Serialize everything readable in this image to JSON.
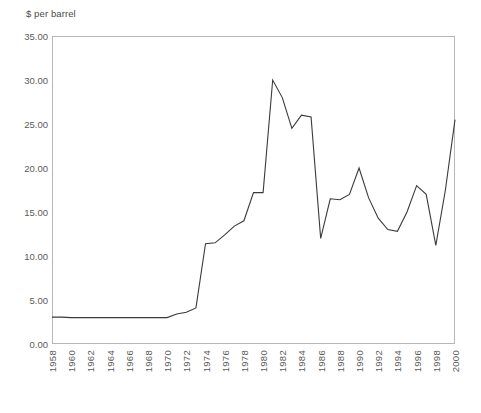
{
  "chart_data": {
    "type": "line",
    "title": "$ per barrel",
    "xlabel": "",
    "ylabel": "$ per barrel",
    "xlim": [
      1958,
      2000
    ],
    "ylim": [
      0,
      35
    ],
    "grid": false,
    "legend": false,
    "y_tick_labels": [
      "35.00",
      "30.00",
      "25.00",
      "20.00",
      "15.00",
      "10.00",
      "5.00",
      "0.00"
    ],
    "y_tick_values": [
      35,
      30,
      25,
      20,
      15,
      10,
      5,
      0
    ],
    "x_tick_labels": [
      "1958",
      "1960",
      "1962",
      "1964",
      "1966",
      "1968",
      "1970",
      "1972",
      "1974",
      "1976",
      "1978",
      "1980",
      "1982",
      "1984",
      "1986",
      "1988",
      "1990",
      "1992",
      "1994",
      "1996",
      "1998",
      "2000"
    ],
    "x_tick_values": [
      1958,
      1960,
      1962,
      1964,
      1966,
      1968,
      1970,
      1972,
      1974,
      1976,
      1978,
      1980,
      1982,
      1984,
      1986,
      1988,
      1990,
      1992,
      1994,
      1996,
      1998,
      2000
    ],
    "line_color": "#3a3a3a",
    "series": [
      {
        "name": "Crude oil price",
        "x": [
          1958,
          1959,
          1960,
          1961,
          1962,
          1963,
          1964,
          1965,
          1966,
          1967,
          1968,
          1969,
          1970,
          1971,
          1972,
          1973,
          1974,
          1975,
          1976,
          1977,
          1978,
          1979,
          1980,
          1981,
          1982,
          1983,
          1984,
          1985,
          1986,
          1987,
          1988,
          1989,
          1990,
          1991,
          1992,
          1993,
          1994,
          1995,
          1996,
          1997,
          1998,
          1999,
          2000
        ],
        "values": [
          3.05,
          3.05,
          3.0,
          3.0,
          3.0,
          3.0,
          3.0,
          3.0,
          3.0,
          3.0,
          3.0,
          3.0,
          3.0,
          3.4,
          3.6,
          4.1,
          11.4,
          11.5,
          12.4,
          13.4,
          14.0,
          17.2,
          17.2,
          30.0,
          28.0,
          24.5,
          26.0,
          25.8,
          12.0,
          16.5,
          16.4,
          17.0,
          20.0,
          16.6,
          14.3,
          13.0,
          12.8,
          15.0,
          18.0,
          17.0,
          11.2,
          17.5,
          25.5
        ]
      }
    ]
  }
}
